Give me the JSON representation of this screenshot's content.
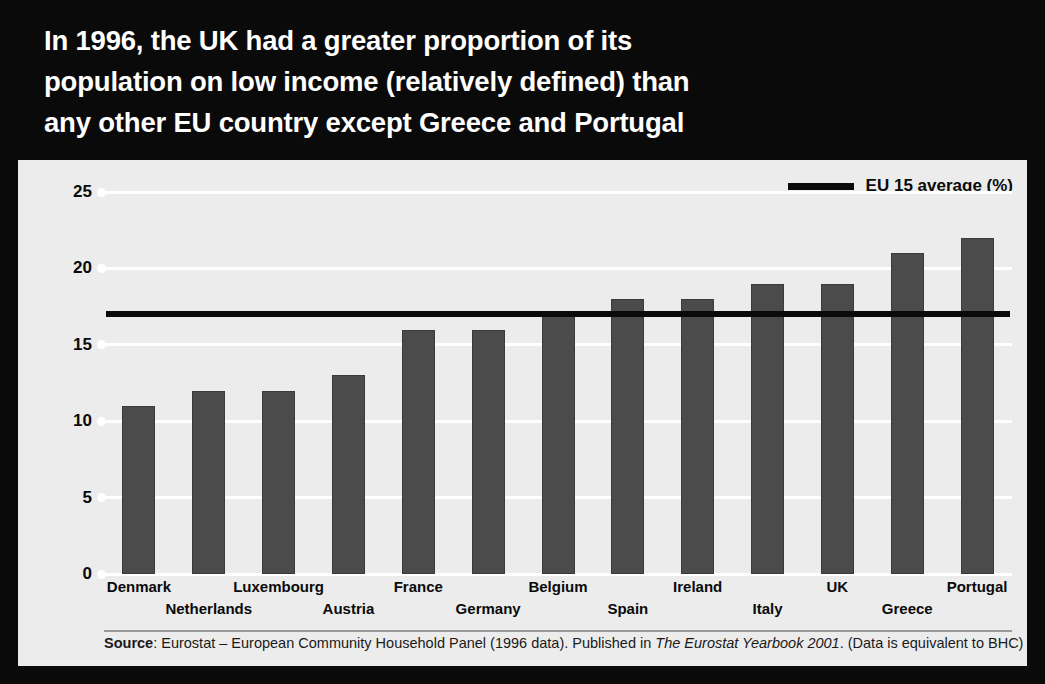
{
  "title": {
    "lines": [
      "In 1996, the UK had a greater proportion of its",
      "population on low income (relatively defined) than",
      "any other EU country except Greece and Portugal"
    ]
  },
  "legend": {
    "label": "EU 15 average (%)"
  },
  "source": {
    "prefix": "Source",
    "part1": ": Eurostat – European Community Household Panel (1996 data). Published in ",
    "italic": "The Eurostat Yearbook 2001",
    "part2": ". (Data is equivalent to BHC)"
  },
  "colors": {
    "banner_background": "#0a0a0a",
    "panel_background": "#ececec",
    "bar": "#4b4b4b",
    "gridline": "#ffffff",
    "average_line": "#0a0a0a",
    "title_text": "#ffffff"
  },
  "chart_data": {
    "type": "bar",
    "title": "In 1996, the UK had a greater proportion of its population on low income (relatively defined) than any other EU country except Greece and Portugal",
    "xlabel": "",
    "ylabel": "Proportion of the population with an income less than 60% of the national median (per cent)",
    "categories": [
      "Denmark",
      "Netherlands",
      "Luxembourg",
      "Austria",
      "France",
      "Germany",
      "Belgium",
      "Spain",
      "Ireland",
      "Italy",
      "UK",
      "Greece",
      "Portugal"
    ],
    "values": [
      11,
      12,
      12,
      13,
      16,
      16,
      17,
      18,
      18,
      19,
      19,
      21,
      22
    ],
    "ylim": [
      0,
      25
    ],
    "yticks": [
      0,
      5,
      10,
      15,
      20,
      25
    ],
    "grid": true,
    "legend_position": "top-right",
    "reference_line": {
      "label": "EU 15 average (%)",
      "value": 17
    }
  }
}
